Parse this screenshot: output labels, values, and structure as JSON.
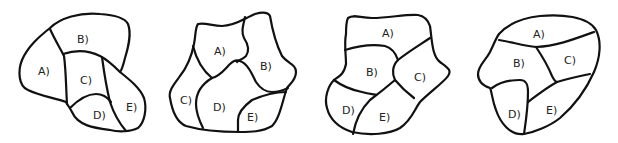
{
  "diagram": {
    "type": "region-map-figures",
    "stroke_color": "#111111",
    "background_color": "#ffffff",
    "figures": [
      {
        "id": "figure-1",
        "regions": [
          {
            "label": "A)",
            "x": 42,
            "y": 72
          },
          {
            "label": "B)",
            "x": 82,
            "y": 41
          },
          {
            "label": "C)",
            "x": 85,
            "y": 82
          },
          {
            "label": "D)",
            "x": 99,
            "y": 117
          },
          {
            "label": "E)",
            "x": 131,
            "y": 108
          }
        ]
      },
      {
        "id": "figure-2",
        "regions": [
          {
            "label": "A)",
            "x": 220,
            "y": 52
          },
          {
            "label": "B)",
            "x": 265,
            "y": 67
          },
          {
            "label": "C)",
            "x": 186,
            "y": 101
          },
          {
            "label": "D)",
            "x": 219,
            "y": 108
          },
          {
            "label": "E)",
            "x": 253,
            "y": 118
          }
        ]
      },
      {
        "id": "figure-3",
        "regions": [
          {
            "label": "A)",
            "x": 387,
            "y": 34
          },
          {
            "label": "B)",
            "x": 372,
            "y": 73
          },
          {
            "label": "C)",
            "x": 419,
            "y": 78
          },
          {
            "label": "D)",
            "x": 348,
            "y": 111
          },
          {
            "label": "E)",
            "x": 384,
            "y": 118
          }
        ]
      },
      {
        "id": "figure-4",
        "regions": [
          {
            "label": "A)",
            "x": 538,
            "y": 35
          },
          {
            "label": "B)",
            "x": 519,
            "y": 64
          },
          {
            "label": "C)",
            "x": 569,
            "y": 61
          },
          {
            "label": "D)",
            "x": 514,
            "y": 115
          },
          {
            "label": "E)",
            "x": 551,
            "y": 111
          }
        ]
      }
    ]
  }
}
